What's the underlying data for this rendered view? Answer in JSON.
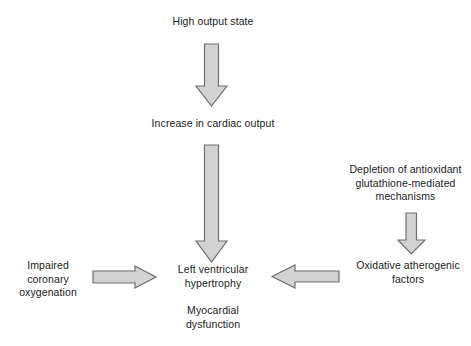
{
  "diagram": {
    "background_color": "#ffffff",
    "text_color": "#1a1a1a",
    "arrow_fill_color": "#d2d2d2",
    "arrow_stroke_color": "#6e6e6e",
    "nodes": [
      {
        "id": "high_output_state",
        "label": "High output state"
      },
      {
        "id": "increase_cardiac_output",
        "label": "Increase in cardiac output"
      },
      {
        "id": "depletion_antioxidant",
        "label": "Depletion of antioxidant\nglutathione-mediated\nmechanisms"
      },
      {
        "id": "oxidative_atherogenic",
        "label": "Oxidative atherogenic\nfactors"
      },
      {
        "id": "impaired_coronary",
        "label": "Impaired\ncoronary\noxygenation"
      },
      {
        "id": "left_ventricular_hypertrophy",
        "label": "Left ventricular\nhypertrophy"
      },
      {
        "id": "myocardial_dysfunction",
        "label": "Myocardial\ndysfunction"
      }
    ],
    "arrows": [
      {
        "id": "high_to_increase",
        "from": "high_output_state",
        "to": "increase_cardiac_output",
        "direction": "down"
      },
      {
        "id": "increase_to_lvh",
        "from": "increase_cardiac_output",
        "to": "left_ventricular_hypertrophy",
        "direction": "down"
      },
      {
        "id": "depletion_to_oxidative",
        "from": "depletion_antioxidant",
        "to": "oxidative_atherogenic",
        "direction": "down"
      },
      {
        "id": "impaired_to_lvh",
        "from": "impaired_coronary",
        "to": "left_ventricular_hypertrophy",
        "direction": "right"
      },
      {
        "id": "oxidative_to_lvh",
        "from": "oxidative_atherogenic",
        "to": "left_ventricular_hypertrophy",
        "direction": "left"
      }
    ]
  }
}
